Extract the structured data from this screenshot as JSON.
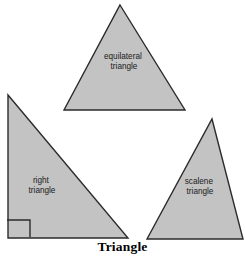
{
  "figure": {
    "caption": "Triangle",
    "background_color": "#ffffff",
    "shape_fill_color": "#c3c3c3",
    "shape_stroke_color": "#2b2b2b"
  },
  "shapes": [
    {
      "id": "equilateral",
      "label_line1": "equilateral",
      "label_line2": "triangle",
      "points": "120,5 185,110 64,110",
      "label_x": 124,
      "label_y": 62
    },
    {
      "id": "right",
      "label_line1": "right",
      "label_line2": "triangle",
      "points": "8,95 128,238 8,238",
      "label_x": 42,
      "label_y": 185,
      "angle_mark": "7,220 30,220 30,237"
    },
    {
      "id": "scalene",
      "label_line1": "scalene",
      "label_line2": "triangle",
      "points": "212,119 243,239 147,239",
      "label_x": 200,
      "label_y": 186
    }
  ],
  "chart_data": {
    "type": "diagram",
    "title": "Triangle",
    "items": [
      {
        "name": "equilateral triangle",
        "description": "all three sides equal, apex up"
      },
      {
        "name": "right triangle",
        "description": "one 90 degree angle marked with a square at the lower left"
      },
      {
        "name": "scalene triangle",
        "description": "all three sides different lengths"
      }
    ]
  }
}
